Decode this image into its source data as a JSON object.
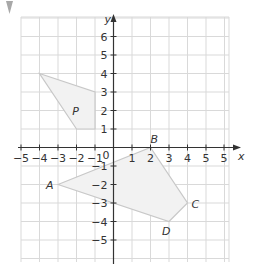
{
  "marker": {
    "icon": "triangle-down-icon",
    "color": "#a8a8a8"
  },
  "grid": {
    "x_min": -5,
    "x_max": 6,
    "y_min": -6,
    "y_max": 7,
    "gridline_color": "#d9d9d9",
    "axis_color": "#333333"
  },
  "axes": {
    "x_label": "x",
    "y_label": "y",
    "origin_label": "0",
    "x_ticks": [
      "−5",
      "−4",
      "−3",
      "−2",
      "−1",
      "1",
      "2",
      "3",
      "4",
      "5",
      "5"
    ],
    "y_ticks": [
      "6",
      "5",
      "4",
      "3",
      "2",
      "1",
      "−1",
      "−2",
      "−3",
      "−4",
      "−5"
    ]
  },
  "shapes": {
    "P": {
      "label": "P",
      "vertices": [
        [
          -4,
          4
        ],
        [
          -1,
          3
        ],
        [
          -1,
          1
        ],
        [
          -2,
          1
        ]
      ],
      "fill": "#f2f2f2",
      "stroke": "#c8c8c8"
    },
    "ABCD": {
      "vertices": [
        {
          "label": "A",
          "x": -3,
          "y": -2
        },
        {
          "label": "B",
          "x": 2,
          "y": 0
        },
        {
          "label": "C",
          "x": 4,
          "y": -3
        },
        {
          "label": "D",
          "x": 3,
          "y": -4
        }
      ],
      "fill": "#f2f2f2",
      "stroke": "#c8c8c8"
    }
  }
}
